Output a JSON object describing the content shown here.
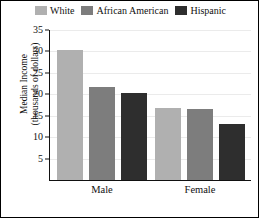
{
  "chart_data": {
    "type": "bar",
    "title": "",
    "xlabel": "",
    "ylabel": "Median Income (thousands of dollars)",
    "ylabel_line1": "Median Income",
    "ylabel_line2": "(thousands of dollars)",
    "categories": [
      "Male",
      "Female"
    ],
    "series": [
      {
        "name": "White",
        "color": "#b0b0b0",
        "values": [
          30.3,
          16.9
        ]
      },
      {
        "name": "African American",
        "color": "#7d7d7d",
        "values": [
          21.6,
          16.6
        ]
      },
      {
        "name": "Hispanic",
        "color": "#2e2e2e",
        "values": [
          20.3,
          13.0
        ]
      }
    ],
    "ylim": [
      0,
      35
    ],
    "yticks": [
      35,
      30,
      25,
      20,
      15,
      10,
      5
    ],
    "ytick_labels": [
      "35",
      "30",
      "25",
      "20",
      "15",
      "10",
      "5"
    ],
    "grid": true,
    "grid_axis": "y",
    "legend_position": "top",
    "orientation": "vertical",
    "bar_group_count": 2,
    "bars_per_group": 3
  },
  "legend": {
    "entries": [
      {
        "label": "White",
        "swatch": "legend-swatch-white",
        "color": "#b0b0b0"
      },
      {
        "label": "African American",
        "swatch": "legend-swatch-african-american",
        "color": "#7d7d7d"
      },
      {
        "label": "Hispanic",
        "swatch": "legend-swatch-hispanic",
        "color": "#2e2e2e"
      }
    ]
  },
  "axis": {
    "y_title_line1": "Median Income",
    "y_title_line2": "(thousands of dollars)",
    "y_tick_35": "35",
    "y_tick_30": "30",
    "y_tick_25": "25",
    "y_tick_20": "20",
    "y_tick_15": "15",
    "y_tick_10": "10",
    "y_tick_5": "5"
  },
  "groups": {
    "male_label": "Male",
    "female_label": "Female"
  }
}
